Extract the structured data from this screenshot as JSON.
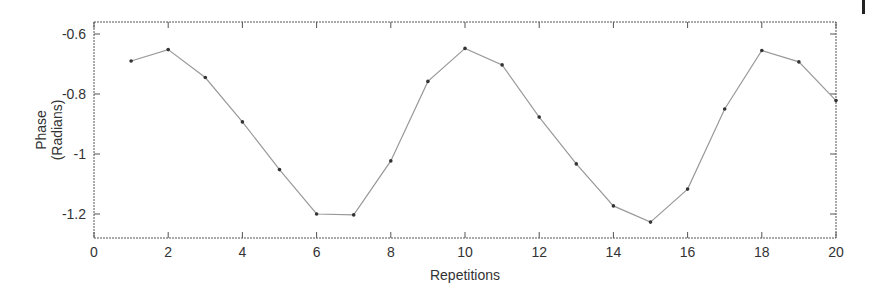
{
  "chart_data": {
    "type": "line",
    "title": "",
    "xlabel": "Repetitions",
    "ylabel": [
      "Phase",
      "(Radians)"
    ],
    "xlim": [
      0,
      20
    ],
    "ylim": [
      -1.28,
      -0.56
    ],
    "xticks": [
      0,
      2,
      4,
      6,
      8,
      10,
      12,
      14,
      16,
      18,
      20
    ],
    "xtick_labels": [
      "0",
      "2",
      "4",
      "6",
      "8",
      "10",
      "12",
      "14",
      "16",
      "18",
      "20"
    ],
    "yticks": [
      -0.6,
      -0.8,
      -1.0,
      -1.2
    ],
    "ytick_labels": [
      "-0.6",
      "-0.8",
      "-1",
      "-1.2"
    ],
    "grid": false,
    "legend": null,
    "x": [
      1,
      2,
      3,
      4,
      5,
      6,
      7,
      8,
      9,
      10,
      11,
      12,
      13,
      14,
      15,
      16,
      17,
      18,
      19,
      20
    ],
    "series": [
      {
        "name": "Phase",
        "values": [
          -0.69,
          -0.652,
          -0.745,
          -0.893,
          -1.052,
          -1.2,
          -1.203,
          -1.023,
          -0.758,
          -0.648,
          -0.703,
          -0.877,
          -1.033,
          -1.173,
          -1.227,
          -1.117,
          -0.85,
          -0.655,
          -0.693,
          -0.822
        ],
        "line_color": "#999999",
        "marker_color": "#333333"
      }
    ]
  },
  "colors": {
    "axis": "#555555",
    "text": "#333333",
    "background": "#ffffff"
  }
}
